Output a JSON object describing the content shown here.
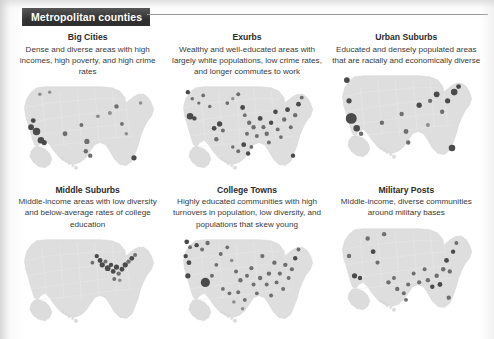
{
  "page": {
    "background_color": "#ffffff",
    "margin_color": "#e8e8e8"
  },
  "header": {
    "banner_label": "Metropolitan counties",
    "banner_bg": "#2f2f2f",
    "banner_text_color": "#ffffff",
    "rule_color": "#8e8e8e"
  },
  "map_style": {
    "land_fill": "#dedede",
    "state_line": "#e9e9e9",
    "marker_fill": "#6e6e6e",
    "marker_dark": "#4a4a4a"
  },
  "panels": [
    {
      "id": "big-cities",
      "title": "Big Cities",
      "description": "Dense and diverse areas with high incomes, high poverty, and high crime rates",
      "map_name": "united-states-map-big-cities",
      "markers": [
        {
          "x": 16,
          "y": 38,
          "r": 2.2,
          "tone": "dark"
        },
        {
          "x": 14,
          "y": 44,
          "r": 2.6,
          "tone": "dark"
        },
        {
          "x": 19,
          "y": 48,
          "r": 3.4,
          "tone": "dark"
        },
        {
          "x": 23,
          "y": 56,
          "r": 3.0,
          "tone": "dark"
        },
        {
          "x": 26,
          "y": 58,
          "r": 2.4,
          "tone": "dark"
        },
        {
          "x": 22,
          "y": 14,
          "r": 1.6,
          "tone": "soft"
        },
        {
          "x": 31,
          "y": 12,
          "r": 1.5,
          "tone": "soft"
        },
        {
          "x": 45,
          "y": 50,
          "r": 2.2,
          "tone": "mid"
        },
        {
          "x": 60,
          "y": 42,
          "r": 1.8,
          "tone": "mid"
        },
        {
          "x": 65,
          "y": 57,
          "r": 2.4,
          "tone": "mid"
        },
        {
          "x": 64,
          "y": 66,
          "r": 2.0,
          "tone": "mid"
        },
        {
          "x": 68,
          "y": 70,
          "r": 2.0,
          "tone": "mid"
        },
        {
          "x": 75,
          "y": 34,
          "r": 1.7,
          "tone": "soft"
        },
        {
          "x": 86,
          "y": 31,
          "r": 1.8,
          "tone": "soft"
        },
        {
          "x": 92,
          "y": 25,
          "r": 2.0,
          "tone": "mid"
        },
        {
          "x": 97,
          "y": 41,
          "r": 1.7,
          "tone": "mid"
        },
        {
          "x": 101,
          "y": 50,
          "r": 1.6,
          "tone": "soft"
        },
        {
          "x": 108,
          "y": 72,
          "r": 2.4,
          "tone": "dark"
        },
        {
          "x": 114,
          "y": 22,
          "r": 1.6,
          "tone": "soft"
        }
      ]
    },
    {
      "id": "exurbs",
      "title": "Exurbs",
      "description": "Wealthy and well-educated areas with largely white populations, low crime rates, and longer commutes to work",
      "map_name": "united-states-map-exurbs",
      "markers": [
        {
          "x": 12,
          "y": 12,
          "r": 2.0,
          "tone": "dark"
        },
        {
          "x": 16,
          "y": 18,
          "r": 1.6,
          "tone": "mid"
        },
        {
          "x": 14,
          "y": 34,
          "r": 3.0,
          "tone": "dark"
        },
        {
          "x": 18,
          "y": 36,
          "r": 2.0,
          "tone": "dark"
        },
        {
          "x": 22,
          "y": 22,
          "r": 1.5,
          "tone": "mid"
        },
        {
          "x": 26,
          "y": 15,
          "r": 1.7,
          "tone": "mid"
        },
        {
          "x": 32,
          "y": 25,
          "r": 1.6,
          "tone": "mid"
        },
        {
          "x": 36,
          "y": 45,
          "r": 2.2,
          "tone": "dark"
        },
        {
          "x": 41,
          "y": 41,
          "r": 2.4,
          "tone": "dark"
        },
        {
          "x": 44,
          "y": 47,
          "r": 1.8,
          "tone": "mid"
        },
        {
          "x": 38,
          "y": 55,
          "r": 2.0,
          "tone": "mid"
        },
        {
          "x": 48,
          "y": 22,
          "r": 1.7,
          "tone": "mid"
        },
        {
          "x": 53,
          "y": 18,
          "r": 1.5,
          "tone": "soft"
        },
        {
          "x": 58,
          "y": 14,
          "r": 1.8,
          "tone": "mid"
        },
        {
          "x": 62,
          "y": 26,
          "r": 2.2,
          "tone": "dark"
        },
        {
          "x": 64,
          "y": 33,
          "r": 1.7,
          "tone": "mid"
        },
        {
          "x": 68,
          "y": 40,
          "r": 2.0,
          "tone": "mid"
        },
        {
          "x": 66,
          "y": 50,
          "r": 1.8,
          "tone": "mid"
        },
        {
          "x": 63,
          "y": 60,
          "r": 2.2,
          "tone": "dark"
        },
        {
          "x": 67,
          "y": 68,
          "r": 2.0,
          "tone": "dark"
        },
        {
          "x": 72,
          "y": 44,
          "r": 2.0,
          "tone": "mid"
        },
        {
          "x": 75,
          "y": 52,
          "r": 1.8,
          "tone": "mid"
        },
        {
          "x": 78,
          "y": 36,
          "r": 2.2,
          "tone": "dark"
        },
        {
          "x": 81,
          "y": 44,
          "r": 1.9,
          "tone": "mid"
        },
        {
          "x": 84,
          "y": 50,
          "r": 2.0,
          "tone": "mid"
        },
        {
          "x": 86,
          "y": 58,
          "r": 1.8,
          "tone": "mid"
        },
        {
          "x": 88,
          "y": 40,
          "r": 2.0,
          "tone": "dark"
        },
        {
          "x": 92,
          "y": 30,
          "r": 2.1,
          "tone": "dark"
        },
        {
          "x": 94,
          "y": 46,
          "r": 1.8,
          "tone": "mid"
        },
        {
          "x": 97,
          "y": 53,
          "r": 1.7,
          "tone": "mid"
        },
        {
          "x": 100,
          "y": 37,
          "r": 2.0,
          "tone": "mid"
        },
        {
          "x": 103,
          "y": 28,
          "r": 2.2,
          "tone": "dark"
        },
        {
          "x": 106,
          "y": 44,
          "r": 1.8,
          "tone": "mid"
        },
        {
          "x": 110,
          "y": 33,
          "r": 2.0,
          "tone": "mid"
        },
        {
          "x": 113,
          "y": 23,
          "r": 2.2,
          "tone": "dark"
        },
        {
          "x": 116,
          "y": 17,
          "r": 1.8,
          "tone": "mid"
        },
        {
          "x": 108,
          "y": 70,
          "r": 2.0,
          "tone": "dark"
        },
        {
          "x": 58,
          "y": 66,
          "r": 1.8,
          "tone": "mid"
        },
        {
          "x": 53,
          "y": 62,
          "r": 1.6,
          "tone": "mid"
        },
        {
          "x": 70,
          "y": 62,
          "r": 1.7,
          "tone": "mid"
        }
      ]
    },
    {
      "id": "urban-suburbs",
      "title": "Urban Suburbs",
      "description": "Educated and densely populated areas that are racially and economically diverse",
      "map_name": "united-states-map-urban-suburbs",
      "markers": [
        {
          "x": 12,
          "y": 11,
          "r": 2.6,
          "tone": "dark"
        },
        {
          "x": 14,
          "y": 30,
          "r": 2.4,
          "tone": "dark"
        },
        {
          "x": 16,
          "y": 46,
          "r": 5.0,
          "tone": "dark"
        },
        {
          "x": 21,
          "y": 55,
          "r": 3.0,
          "tone": "dark"
        },
        {
          "x": 25,
          "y": 60,
          "r": 2.0,
          "tone": "mid"
        },
        {
          "x": 44,
          "y": 50,
          "r": 2.0,
          "tone": "mid"
        },
        {
          "x": 62,
          "y": 42,
          "r": 2.0,
          "tone": "mid"
        },
        {
          "x": 66,
          "y": 58,
          "r": 2.2,
          "tone": "mid"
        },
        {
          "x": 68,
          "y": 68,
          "r": 2.0,
          "tone": "mid"
        },
        {
          "x": 78,
          "y": 34,
          "r": 2.4,
          "tone": "dark"
        },
        {
          "x": 88,
          "y": 30,
          "r": 2.0,
          "tone": "mid"
        },
        {
          "x": 94,
          "y": 24,
          "r": 2.6,
          "tone": "dark"
        },
        {
          "x": 99,
          "y": 40,
          "r": 2.0,
          "tone": "mid"
        },
        {
          "x": 104,
          "y": 30,
          "r": 2.4,
          "tone": "dark"
        },
        {
          "x": 110,
          "y": 22,
          "r": 3.0,
          "tone": "dark"
        },
        {
          "x": 114,
          "y": 17,
          "r": 2.2,
          "tone": "dark"
        },
        {
          "x": 108,
          "y": 73,
          "r": 3.0,
          "tone": "dark"
        },
        {
          "x": 86,
          "y": 52,
          "r": 1.8,
          "tone": "soft"
        }
      ]
    },
    {
      "id": "middle-suburbs",
      "title": "Middle Suburbs",
      "description": "Middle-income areas with low diversity and below-average rates of college education",
      "map_name": "united-states-map-middle-suburbs",
      "markers": [
        {
          "x": 74,
          "y": 22,
          "r": 2.0,
          "tone": "dark"
        },
        {
          "x": 77,
          "y": 26,
          "r": 2.2,
          "tone": "dark"
        },
        {
          "x": 79,
          "y": 30,
          "r": 2.4,
          "tone": "dark"
        },
        {
          "x": 82,
          "y": 27,
          "r": 1.8,
          "tone": "mid"
        },
        {
          "x": 84,
          "y": 33,
          "r": 2.6,
          "tone": "dark"
        },
        {
          "x": 87,
          "y": 30,
          "r": 2.0,
          "tone": "dark"
        },
        {
          "x": 89,
          "y": 36,
          "r": 2.2,
          "tone": "dark"
        },
        {
          "x": 92,
          "y": 32,
          "r": 2.4,
          "tone": "dark"
        },
        {
          "x": 94,
          "y": 38,
          "r": 2.0,
          "tone": "mid"
        },
        {
          "x": 97,
          "y": 34,
          "r": 2.2,
          "tone": "dark"
        },
        {
          "x": 100,
          "y": 30,
          "r": 2.4,
          "tone": "dark"
        },
        {
          "x": 103,
          "y": 27,
          "r": 2.0,
          "tone": "mid"
        },
        {
          "x": 106,
          "y": 24,
          "r": 2.2,
          "tone": "dark"
        },
        {
          "x": 109,
          "y": 21,
          "r": 1.8,
          "tone": "mid"
        },
        {
          "x": 90,
          "y": 43,
          "r": 1.8,
          "tone": "mid"
        },
        {
          "x": 95,
          "y": 44,
          "r": 1.6,
          "tone": "soft"
        },
        {
          "x": 70,
          "y": 28,
          "r": 1.7,
          "tone": "mid"
        }
      ]
    },
    {
      "id": "college-towns",
      "title": "College Towns",
      "description": "Highly educated communities with high turnovers in population, low diversity, and populations that skew young",
      "map_name": "united-states-map-college-towns",
      "markers": [
        {
          "x": 11,
          "y": 9,
          "r": 2.2,
          "tone": "dark"
        },
        {
          "x": 14,
          "y": 14,
          "r": 1.8,
          "tone": "mid"
        },
        {
          "x": 10,
          "y": 22,
          "r": 2.0,
          "tone": "dark"
        },
        {
          "x": 13,
          "y": 28,
          "r": 2.2,
          "tone": "dark"
        },
        {
          "x": 12,
          "y": 40,
          "r": 2.4,
          "tone": "dark"
        },
        {
          "x": 20,
          "y": 12,
          "r": 2.0,
          "tone": "dark"
        },
        {
          "x": 25,
          "y": 16,
          "r": 1.8,
          "tone": "mid"
        },
        {
          "x": 30,
          "y": 10,
          "r": 2.0,
          "tone": "mid"
        },
        {
          "x": 28,
          "y": 46,
          "r": 4.2,
          "tone": "dark"
        },
        {
          "x": 34,
          "y": 40,
          "r": 1.8,
          "tone": "mid"
        },
        {
          "x": 38,
          "y": 30,
          "r": 1.7,
          "tone": "mid"
        },
        {
          "x": 42,
          "y": 20,
          "r": 1.8,
          "tone": "mid"
        },
        {
          "x": 48,
          "y": 14,
          "r": 1.7,
          "tone": "mid"
        },
        {
          "x": 52,
          "y": 26,
          "r": 1.6,
          "tone": "soft"
        },
        {
          "x": 56,
          "y": 36,
          "r": 1.8,
          "tone": "mid"
        },
        {
          "x": 60,
          "y": 44,
          "r": 2.0,
          "tone": "mid"
        },
        {
          "x": 58,
          "y": 55,
          "r": 1.8,
          "tone": "mid"
        },
        {
          "x": 64,
          "y": 62,
          "r": 1.7,
          "tone": "mid"
        },
        {
          "x": 66,
          "y": 40,
          "r": 1.8,
          "tone": "mid"
        },
        {
          "x": 70,
          "y": 33,
          "r": 1.9,
          "tone": "mid"
        },
        {
          "x": 72,
          "y": 48,
          "r": 1.8,
          "tone": "mid"
        },
        {
          "x": 75,
          "y": 56,
          "r": 1.7,
          "tone": "mid"
        },
        {
          "x": 78,
          "y": 42,
          "r": 2.0,
          "tone": "mid"
        },
        {
          "x": 80,
          "y": 22,
          "r": 1.9,
          "tone": "mid"
        },
        {
          "x": 84,
          "y": 48,
          "r": 1.8,
          "tone": "mid"
        },
        {
          "x": 86,
          "y": 38,
          "r": 2.0,
          "tone": "mid"
        },
        {
          "x": 88,
          "y": 58,
          "r": 1.8,
          "tone": "mid"
        },
        {
          "x": 91,
          "y": 28,
          "r": 2.0,
          "tone": "mid"
        },
        {
          "x": 93,
          "y": 46,
          "r": 1.8,
          "tone": "mid"
        },
        {
          "x": 96,
          "y": 38,
          "r": 1.9,
          "tone": "mid"
        },
        {
          "x": 99,
          "y": 52,
          "r": 1.8,
          "tone": "mid"
        },
        {
          "x": 101,
          "y": 30,
          "r": 2.0,
          "tone": "mid"
        },
        {
          "x": 104,
          "y": 42,
          "r": 1.8,
          "tone": "mid"
        },
        {
          "x": 107,
          "y": 34,
          "r": 1.9,
          "tone": "mid"
        },
        {
          "x": 110,
          "y": 24,
          "r": 2.0,
          "tone": "dark"
        },
        {
          "x": 113,
          "y": 16,
          "r": 1.8,
          "tone": "mid"
        },
        {
          "x": 50,
          "y": 56,
          "r": 1.7,
          "tone": "mid"
        },
        {
          "x": 54,
          "y": 64,
          "r": 1.6,
          "tone": "soft"
        },
        {
          "x": 44,
          "y": 52,
          "r": 1.7,
          "tone": "mid"
        },
        {
          "x": 62,
          "y": 70,
          "r": 1.6,
          "tone": "soft"
        }
      ]
    },
    {
      "id": "military-posts",
      "title": "Military Posts",
      "description": "Middle-income, diverse communities around military bases",
      "map_name": "united-states-map-military-posts",
      "markers": [
        {
          "x": 14,
          "y": 32,
          "r": 2.0,
          "tone": "mid"
        },
        {
          "x": 19,
          "y": 50,
          "r": 2.4,
          "tone": "dark"
        },
        {
          "x": 24,
          "y": 52,
          "r": 2.0,
          "tone": "dark"
        },
        {
          "x": 31,
          "y": 16,
          "r": 2.0,
          "tone": "mid"
        },
        {
          "x": 36,
          "y": 28,
          "r": 2.2,
          "tone": "dark"
        },
        {
          "x": 40,
          "y": 38,
          "r": 1.9,
          "tone": "mid"
        },
        {
          "x": 46,
          "y": 12,
          "r": 2.0,
          "tone": "mid"
        },
        {
          "x": 50,
          "y": 56,
          "r": 2.0,
          "tone": "mid"
        },
        {
          "x": 55,
          "y": 52,
          "r": 1.8,
          "tone": "mid"
        },
        {
          "x": 58,
          "y": 62,
          "r": 2.0,
          "tone": "mid"
        },
        {
          "x": 64,
          "y": 66,
          "r": 1.8,
          "tone": "mid"
        },
        {
          "x": 68,
          "y": 58,
          "r": 1.9,
          "tone": "mid"
        },
        {
          "x": 73,
          "y": 48,
          "r": 1.8,
          "tone": "mid"
        },
        {
          "x": 78,
          "y": 56,
          "r": 1.9,
          "tone": "mid"
        },
        {
          "x": 83,
          "y": 44,
          "r": 1.8,
          "tone": "mid"
        },
        {
          "x": 86,
          "y": 54,
          "r": 2.0,
          "tone": "mid"
        },
        {
          "x": 90,
          "y": 60,
          "r": 2.0,
          "tone": "dark"
        },
        {
          "x": 94,
          "y": 50,
          "r": 2.0,
          "tone": "mid"
        },
        {
          "x": 97,
          "y": 58,
          "r": 2.2,
          "tone": "dark"
        },
        {
          "x": 100,
          "y": 44,
          "r": 2.0,
          "tone": "mid"
        },
        {
          "x": 103,
          "y": 36,
          "r": 2.2,
          "tone": "dark"
        },
        {
          "x": 106,
          "y": 46,
          "r": 2.0,
          "tone": "mid"
        },
        {
          "x": 109,
          "y": 28,
          "r": 2.0,
          "tone": "dark"
        },
        {
          "x": 112,
          "y": 20,
          "r": 1.8,
          "tone": "mid"
        },
        {
          "x": 105,
          "y": 70,
          "r": 2.0,
          "tone": "mid"
        },
        {
          "x": 66,
          "y": 72,
          "r": 1.8,
          "tone": "mid"
        }
      ]
    }
  ]
}
